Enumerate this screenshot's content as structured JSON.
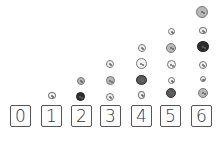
{
  "cards": [
    {
      "label": "0",
      "x": 10,
      "count": 0
    },
    {
      "label": "1",
      "x": 41,
      "count": 1
    },
    {
      "label": "2",
      "x": 71,
      "count": 2
    },
    {
      "label": "3",
      "x": 100,
      "count": 3
    },
    {
      "label": "4",
      "x": 131,
      "count": 4
    },
    {
      "label": "5",
      "x": 160,
      "count": 5
    },
    {
      "label": "6",
      "x": 191,
      "count": 6
    }
  ],
  "colors": {
    "outline": "#555555",
    "dark_button": "#2e2e2e",
    "mid_button": "#b8b8b8",
    "light_button": "#f2f2f2"
  }
}
